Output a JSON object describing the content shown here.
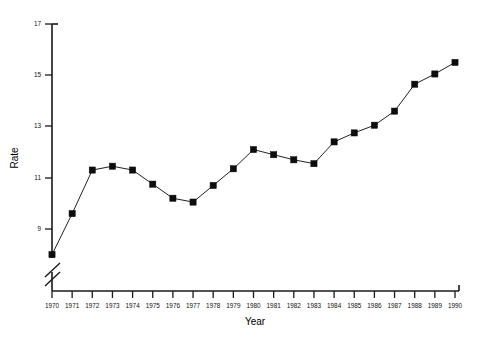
{
  "chart_data": {
    "type": "line",
    "title": "",
    "xlabel": "Year",
    "ylabel": "Rate",
    "categories": [
      "1970",
      "1971",
      "1972",
      "1973",
      "1974",
      "1975",
      "1976",
      "1977",
      "1978",
      "1979",
      "1980",
      "1981",
      "1982",
      "1983",
      "1984",
      "1985",
      "1986",
      "1987",
      "1988",
      "1989",
      "1990"
    ],
    "values": [
      8.0,
      9.6,
      11.3,
      11.45,
      11.3,
      10.75,
      10.2,
      10.05,
      10.7,
      11.35,
      12.1,
      11.9,
      11.7,
      11.55,
      12.4,
      12.75,
      13.05,
      13.6,
      14.65,
      15.05,
      15.5
    ],
    "series": [
      {
        "name": "Rate",
        "values": [
          8.0,
          9.6,
          11.3,
          11.45,
          11.3,
          10.75,
          10.2,
          10.05,
          10.7,
          11.35,
          12.1,
          11.9,
          11.7,
          11.55,
          12.4,
          12.75,
          13.05,
          13.6,
          14.65,
          15.05,
          15.5
        ]
      }
    ],
    "ytick_labels": [
      "17",
      "15",
      "13",
      "11",
      "9"
    ],
    "ytick_values": [
      17,
      15,
      13,
      11,
      9
    ],
    "ylim": [
      8.6,
      17
    ],
    "xlim": [
      "1970",
      "1990"
    ],
    "grid": false,
    "legend": "none",
    "axis_break": {
      "axis": "y",
      "style": "double-slash",
      "note": "y-axis broken below 9"
    },
    "marker_style": "filled-square",
    "line_color": "#222222",
    "marker_color": "#0d0d0d"
  },
  "figure": {
    "background": "#ffffff"
  }
}
